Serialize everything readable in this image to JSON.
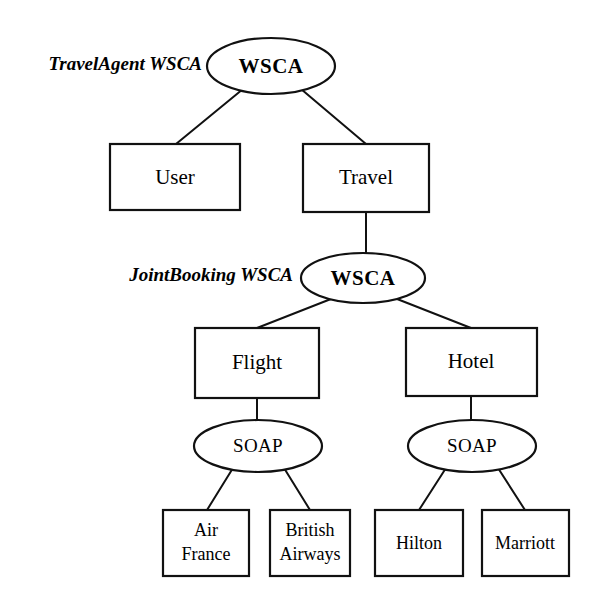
{
  "diagram": {
    "type": "tree-diagram",
    "background_color": "#ffffff",
    "line_color": "#111111",
    "annotations": [
      {
        "id": "annotation-travelagent",
        "text": "TravelAgent WSCA",
        "x": 205,
        "y": 66,
        "style": "bold-italic-serif"
      },
      {
        "id": "annotation-jointbooking",
        "text": "JointBooking WSCA",
        "x": 296,
        "y": 277,
        "style": "bold-italic-serif"
      }
    ],
    "nodes": [
      {
        "id": "wsca-top",
        "label": "WSCA",
        "shape": "ellipse",
        "cx": 271,
        "cy": 66,
        "rx": 64,
        "ry": 28,
        "label_class": "label-conn-wsca"
      },
      {
        "id": "box-user",
        "label": "User",
        "shape": "rect",
        "x": 110,
        "y": 144,
        "w": 130,
        "h": 66,
        "lines": [
          "User"
        ],
        "label_class": "label-box"
      },
      {
        "id": "box-travel",
        "label": "Travel",
        "shape": "rect",
        "x": 303,
        "y": 144,
        "w": 126,
        "h": 68,
        "lines": [
          "Travel"
        ],
        "label_class": "label-box"
      },
      {
        "id": "wsca-joint",
        "label": "WSCA",
        "shape": "ellipse",
        "cx": 363,
        "cy": 278,
        "rx": 62,
        "ry": 25,
        "label_class": "label-conn-wsca"
      },
      {
        "id": "box-flight",
        "label": "Flight",
        "shape": "rect",
        "x": 195,
        "y": 328,
        "w": 124,
        "h": 70,
        "lines": [
          "Flight"
        ],
        "label_class": "label-box"
      },
      {
        "id": "box-hotel",
        "label": "Hotel",
        "shape": "rect",
        "x": 406,
        "y": 328,
        "w": 131,
        "h": 68,
        "lines": [
          "Hotel"
        ],
        "label_class": "label-box"
      },
      {
        "id": "soap-flight",
        "label": "SOAP",
        "shape": "ellipse",
        "cx": 258,
        "cy": 446,
        "rx": 64,
        "ry": 26,
        "label_class": "label-conn-soap"
      },
      {
        "id": "soap-hotel",
        "label": "SOAP",
        "shape": "ellipse",
        "cx": 472,
        "cy": 446,
        "rx": 64,
        "ry": 26,
        "label_class": "label-conn-soap"
      },
      {
        "id": "box-air-france",
        "label": "Air France",
        "shape": "rect",
        "x": 163,
        "y": 510,
        "w": 86,
        "h": 66,
        "lines": [
          "Air",
          "France"
        ],
        "label_class": "label-box-small"
      },
      {
        "id": "box-british-airways",
        "label": "British Airways",
        "shape": "rect",
        "x": 270,
        "y": 510,
        "w": 80,
        "h": 66,
        "lines": [
          "British",
          "Airways"
        ],
        "label_class": "label-box-small"
      },
      {
        "id": "box-hilton",
        "label": "Hilton",
        "shape": "rect",
        "x": 375,
        "y": 510,
        "w": 88,
        "h": 66,
        "lines": [
          "Hilton"
        ],
        "label_class": "label-box-small"
      },
      {
        "id": "box-marriott",
        "label": "Marriott",
        "shape": "rect",
        "x": 482,
        "y": 510,
        "w": 87,
        "h": 66,
        "lines": [
          "Marriott"
        ],
        "label_class": "label-box-small"
      }
    ],
    "edges": [
      {
        "id": "edge-wsca-top-user",
        "from": "wsca-top",
        "to": "box-user",
        "x1": 243,
        "y1": 89,
        "x2": 176,
        "y2": 144
      },
      {
        "id": "edge-wsca-top-travel",
        "from": "wsca-top",
        "to": "box-travel",
        "x1": 301,
        "y1": 89,
        "x2": 366,
        "y2": 144
      },
      {
        "id": "edge-travel-wsca-joint",
        "from": "box-travel",
        "to": "wsca-joint",
        "x1": 366,
        "y1": 212,
        "x2": 366,
        "y2": 254
      },
      {
        "id": "edge-wsca-joint-flight",
        "from": "wsca-joint",
        "to": "box-flight",
        "x1": 336,
        "y1": 298,
        "x2": 257,
        "y2": 328
      },
      {
        "id": "edge-wsca-joint-hotel",
        "from": "wsca-joint",
        "to": "box-hotel",
        "x1": 392,
        "y1": 298,
        "x2": 471,
        "y2": 328
      },
      {
        "id": "edge-flight-soap",
        "from": "box-flight",
        "to": "soap-flight",
        "x1": 257,
        "y1": 398,
        "x2": 257,
        "y2": 421
      },
      {
        "id": "edge-hotel-soap",
        "from": "box-hotel",
        "to": "soap-hotel",
        "x1": 471,
        "y1": 396,
        "x2": 471,
        "y2": 421
      },
      {
        "id": "edge-soap-air-france",
        "from": "soap-flight",
        "to": "box-air-france",
        "x1": 232,
        "y1": 468,
        "x2": 206,
        "y2": 510
      },
      {
        "id": "edge-soap-british-airways",
        "from": "soap-flight",
        "to": "box-british-airways",
        "x1": 285,
        "y1": 468,
        "x2": 310,
        "y2": 510
      },
      {
        "id": "edge-soap-hilton",
        "from": "soap-hotel",
        "to": "box-hilton",
        "x1": 446,
        "y1": 468,
        "x2": 419,
        "y2": 510
      },
      {
        "id": "edge-soap-marriott",
        "from": "soap-hotel",
        "to": "box-marriott",
        "x1": 498,
        "y1": 468,
        "x2": 525,
        "y2": 510
      }
    ]
  }
}
